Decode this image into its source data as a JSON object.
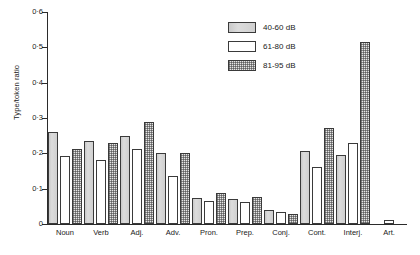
{
  "chart_data": {
    "type": "bar",
    "title": "",
    "subtitle": "",
    "xlabel": "",
    "ylabel": "Type/token ratio",
    "ylim": [
      0,
      0.6
    ],
    "grid": false,
    "legend_position": "top-right",
    "categories": [
      "Noun",
      "Verb",
      "Adj.",
      "Adv.",
      "Pron.",
      "Prep.",
      "Conj.",
      "Cont.",
      "Interj.",
      "Art."
    ],
    "ytick_labels": [
      "0",
      "0·1",
      "0·2",
      "0·3",
      "0·4",
      "0·5",
      "0·6"
    ],
    "ytick_values": [
      0,
      0.1,
      0.2,
      0.3,
      0.4,
      0.5,
      0.6
    ],
    "series": [
      {
        "name": "40-60 dB",
        "fill": "solid",
        "color": "#d4d4d4",
        "values": [
          0.26,
          0.235,
          0.25,
          0.2,
          0.075,
          0.07,
          0.04,
          0.207,
          0.195,
          0.0
        ]
      },
      {
        "name": "61-80 dB",
        "fill": "white",
        "color": "#ffffff",
        "values": [
          0.193,
          0.18,
          0.213,
          0.137,
          0.065,
          0.062,
          0.033,
          0.162,
          0.23,
          0.01
        ]
      },
      {
        "name": "81-95 dB",
        "fill": "hatch",
        "color": "#e6e6e6",
        "values": [
          0.212,
          0.228,
          0.288,
          0.2,
          0.088,
          0.077,
          0.028,
          0.272,
          0.515,
          0.0
        ]
      }
    ]
  },
  "legend": {
    "items": [
      {
        "label": "40-60 dB",
        "fill": "solid"
      },
      {
        "label": "61-80 dB",
        "fill": "white"
      },
      {
        "label": "81-95 dB",
        "fill": "hatch"
      }
    ]
  }
}
